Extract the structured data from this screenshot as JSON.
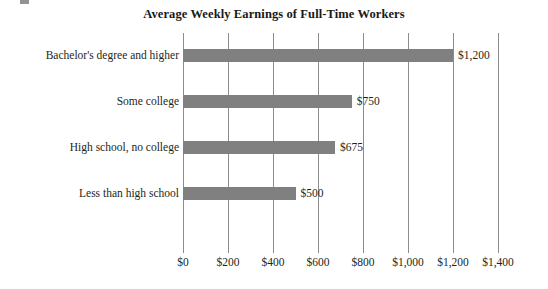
{
  "chart_data": {
    "type": "bar",
    "orientation": "horizontal",
    "title": "Average Weekly Earnings of Full-Time Workers",
    "xlabel": "",
    "ylabel": "",
    "grid": true,
    "legend": false,
    "xlim": [
      0,
      1400
    ],
    "xticks": [
      0,
      200,
      400,
      600,
      800,
      1000,
      1200,
      1400
    ],
    "xtick_labels": [
      "$0",
      "$200",
      "$400",
      "$600",
      "$800",
      "$1,000",
      "$1,200",
      "$1,400"
    ],
    "categories": [
      "Bachelor's degree and higher",
      "Some college",
      "High school, no college",
      "Less than high school"
    ],
    "values": [
      1200,
      750,
      675,
      500
    ],
    "value_labels": [
      "$1,200",
      "$750",
      "$675",
      "$500"
    ],
    "bar_color": "#808080",
    "gridline_color": "#8c8c8c",
    "text_color": "#231f20",
    "background_color": "#ffffff"
  }
}
